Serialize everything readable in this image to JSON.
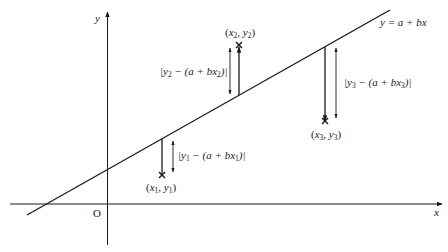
{
  "diagram": {
    "colors": {
      "ink": "#1a1a1a",
      "background": "#ffffff"
    },
    "axes": {
      "x_label": "x",
      "y_label": "y",
      "origin_label": "O"
    },
    "regression_line": {
      "label": "y = a + bx"
    },
    "points": [
      {
        "name": "point-1",
        "label_x": "x",
        "label_sub1": "1",
        "label_sep": ", ",
        "label_y": "y",
        "label_sub2": "1",
        "residual_pre": "|y",
        "residual_sub1": "1",
        "residual_mid": " − (a + bx",
        "residual_sub2": "1",
        "residual_post": ")|",
        "position": "below line"
      },
      {
        "name": "point-2",
        "label_x": "x",
        "label_sub1": "2",
        "label_sep": ", ",
        "label_y": "y",
        "label_sub2": "2",
        "residual_pre": "|y",
        "residual_sub1": "2",
        "residual_mid": " − (a + bx",
        "residual_sub2": "2",
        "residual_post": ")|",
        "position": "above line"
      },
      {
        "name": "point-3",
        "label_x": "x",
        "label_sub1": "3",
        "label_sep": ", ",
        "label_y": "y",
        "label_sub2": "3",
        "residual_pre": "|y",
        "residual_sub1": "3",
        "residual_mid": " − (a + bx",
        "residual_sub2": "3",
        "residual_post": ")|",
        "position": "below line"
      }
    ]
  }
}
